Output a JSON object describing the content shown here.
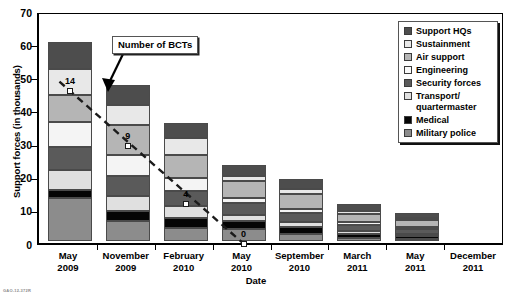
{
  "chart_data": {
    "type": "bar",
    "subtype": "stacked-bar",
    "title": "",
    "xlabel": "Date",
    "ylabel": "Support forces (in thousands)",
    "ylim": [
      0,
      70
    ],
    "yticks": [
      0,
      10,
      20,
      30,
      40,
      50,
      60,
      70
    ],
    "grid": false,
    "legend_position": "top-right",
    "categories": [
      "May\n2009",
      "November\n2009",
      "February\n2010",
      "May\n2010",
      "September\n2010",
      "March\n2011",
      "May\n2011",
      "December\n2011"
    ],
    "category_lines": [
      [
        "May",
        "2009"
      ],
      [
        "November",
        "2009"
      ],
      [
        "February",
        "2010"
      ],
      [
        "May",
        "2010"
      ],
      [
        "September",
        "2010"
      ],
      [
        "March",
        "2011"
      ],
      [
        "May",
        "2011"
      ],
      [
        "December",
        "2011"
      ]
    ],
    "stack_order_bottom_to_top": [
      "Military police",
      "Medical",
      "Transport/\nquartermaster",
      "Security forces",
      "Engineering",
      "Air support",
      "Sustainment",
      "Support HQs"
    ],
    "series": [
      {
        "name": "Support HQs",
        "color": "#4d4d4d",
        "values": [
          8.0,
          6.0,
          4.5,
          3.5,
          3.0,
          2.0,
          1.5,
          0
        ]
      },
      {
        "name": "Sustainment",
        "color": "#e8e8e8",
        "values": [
          8.0,
          6.0,
          5.0,
          1.5,
          1.5,
          1.0,
          0.8,
          0
        ]
      },
      {
        "name": "Air support",
        "color": "#b5b5b5",
        "values": [
          8.0,
          9.0,
          7.0,
          5.0,
          4.5,
          2.5,
          2.0,
          0
        ]
      },
      {
        "name": "Engineering",
        "color": "#f4f4f4",
        "values": [
          7.5,
          6.5,
          4.0,
          1.5,
          1.2,
          0.8,
          0.6,
          0
        ]
      },
      {
        "name": "Security forces",
        "color": "#5a5a5a",
        "values": [
          7.0,
          6.0,
          4.5,
          3.5,
          2.8,
          1.8,
          1.4,
          0
        ]
      },
      {
        "name": "Transport/\nquartermaster",
        "color": "#e0e0e0",
        "values": [
          6.0,
          4.5,
          3.5,
          2.0,
          1.5,
          1.0,
          0.8,
          0
        ]
      },
      {
        "name": "Medical",
        "color": "#050505",
        "values": [
          2.5,
          3.0,
          3.0,
          2.5,
          2.0,
          1.0,
          0.8,
          0
        ]
      },
      {
        "name": "Military police",
        "color": "#8c8c8c",
        "values": [
          13.0,
          6.0,
          4.0,
          3.5,
          2.2,
          1.0,
          0.6,
          0
        ]
      }
    ],
    "totals": [
      60.0,
      47.0,
      35.5,
      23.0,
      18.7,
      11.1,
      8.5,
      0
    ],
    "annotation": {
      "callout_label": "Number of BCTs",
      "series_name": "Number of BCTs",
      "markers": [
        {
          "category": "May 2009",
          "value": "14",
          "y": 46.5
        },
        {
          "category": "November 2009",
          "value": "9",
          "y": 30.0
        },
        {
          "category": "February 2010",
          "value": "4",
          "y": 12.5
        },
        {
          "category": "May 2010",
          "value": "0",
          "y": 0.4
        }
      ]
    }
  },
  "legend": {
    "items": [
      {
        "label": "Support HQs",
        "color": "#4d4d4d",
        "swatch_name": "legend-swatch-support-hqs"
      },
      {
        "label": "Sustainment",
        "color": "#e8e8e8",
        "swatch_name": "legend-swatch-sustainment"
      },
      {
        "label": "Air support",
        "color": "#b5b5b5",
        "swatch_name": "legend-swatch-air-support"
      },
      {
        "label": "Engineering",
        "color": "#fbfbfb",
        "swatch_name": "legend-swatch-engineering"
      },
      {
        "label": "Security forces",
        "color": "#5a5a5a",
        "swatch_name": "legend-swatch-security-forces"
      },
      {
        "label": "Transport/\nquartermaster",
        "color": "#e0e0e0",
        "swatch_name": "legend-swatch-transport-quartermaster"
      },
      {
        "label": "Medical",
        "color": "#050505",
        "swatch_name": "legend-swatch-medical"
      },
      {
        "label": "Military police",
        "color": "#8c8c8c",
        "swatch_name": "legend-swatch-military-police"
      }
    ]
  },
  "axes": {
    "y_title": "Support forces (in thousands)",
    "x_title": "Date",
    "y_tick_labels": [
      "0",
      "10",
      "20",
      "30",
      "40",
      "50",
      "60",
      "70"
    ]
  },
  "footer": {
    "source_note": "GAO-12-372R"
  },
  "colors": {
    "axis": "#000000",
    "segment_border": "#4a4a4a",
    "annotation_line": "#1b1b1b",
    "background": "#ffffff"
  }
}
